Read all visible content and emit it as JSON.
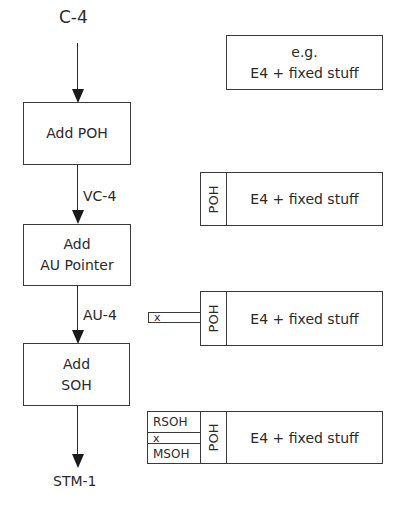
{
  "flow": {
    "input_label": "C-4",
    "steps": [
      {
        "lines": [
          "Add POH"
        ]
      },
      {
        "lines": [
          "Add",
          "AU Pointer"
        ]
      },
      {
        "lines": [
          "Add",
          "SOH"
        ]
      }
    ],
    "edge_labels": [
      "VC-4",
      "AU-4"
    ],
    "output_label": "STM-1"
  },
  "frames": {
    "example": {
      "line1": "e.g.",
      "line2": "E4 + fixed stuff"
    },
    "vc4": {
      "poh": "POH",
      "payload": "E4 + fixed stuff"
    },
    "au4": {
      "pointer": "x",
      "poh": "POH",
      "payload": "E4 + fixed stuff"
    },
    "stm1": {
      "rsoh": "RSOH",
      "pointer": "x",
      "msoh": "MSOH",
      "poh": "POH",
      "payload": "E4 + fixed stuff"
    }
  },
  "colors": {
    "line": "#3a3a3a",
    "text": "#2a2a2a",
    "background": "#ffffff"
  }
}
